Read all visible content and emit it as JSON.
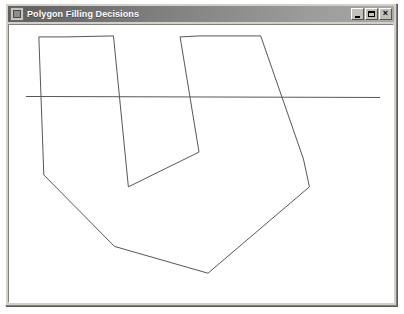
{
  "window": {
    "title": "Polygon Filling Decisions",
    "icon": "application-icon",
    "buttons": {
      "minimize": "_",
      "maximize": "□",
      "close": "×"
    }
  },
  "canvas": {
    "background_color": "#ffffff",
    "stroke_color": "#555555",
    "stroke_width": 1,
    "view_box": "0 0 386 279",
    "polygon": {
      "name": "filled-polygon-outline",
      "closed": true,
      "points": "52 151 35 151 30 12 57 12 105 11 100 163 120 163 191 128 172 12 192 11 253 11 276 135 296 135 302 163 200 250 106 223"
    },
    "polygon_vertices": [
      {
        "x": 30,
        "y": 12
      },
      {
        "x": 57,
        "y": 12
      },
      {
        "x": 105,
        "y": 11
      },
      {
        "x": 120,
        "y": 163
      },
      {
        "x": 191,
        "y": 128
      },
      {
        "x": 172,
        "y": 12
      },
      {
        "x": 192,
        "y": 11
      },
      {
        "x": 253,
        "y": 11
      },
      {
        "x": 296,
        "y": 135
      },
      {
        "x": 302,
        "y": 163
      },
      {
        "x": 200,
        "y": 250
      },
      {
        "x": 106,
        "y": 223
      },
      {
        "x": 35,
        "y": 151
      }
    ],
    "scanline": {
      "name": "scanline",
      "x1": 17,
      "y1": 72,
      "x2": 373,
      "y2": 73
    }
  }
}
